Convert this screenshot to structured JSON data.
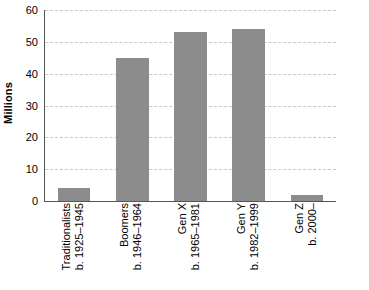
{
  "chart_data": {
    "type": "bar",
    "title": "",
    "xlabel": "",
    "ylabel": "Millions",
    "ylim": [
      0,
      60
    ],
    "grid": true,
    "legend": "none",
    "categories": [
      "Traditionalists b. 1925–1945",
      "Boomers b. 1946–1964",
      "Gen X b. 1965–1981",
      "Gen Y b. 1982–1999",
      "Gen Z b. 2000–"
    ],
    "values": [
      4,
      45,
      53,
      54,
      2
    ],
    "yticks": [
      0,
      10,
      20,
      30,
      40,
      50,
      60
    ],
    "bar_color": "#8c8c8c",
    "gridline_color": "#c8c8c8",
    "axis_color": "#555555"
  },
  "axis": {
    "y_title": "Millions",
    "ticks": [
      {
        "label": "60",
        "value": 60
      },
      {
        "label": "50",
        "value": 50
      },
      {
        "label": "40",
        "value": 40
      },
      {
        "label": "30",
        "value": 30
      },
      {
        "label": "20",
        "value": 20
      },
      {
        "label": "10",
        "value": 10
      },
      {
        "label": "0",
        "value": 0
      }
    ]
  },
  "categories": [
    {
      "name": "Traditionalists",
      "years": "b. 1925–1945",
      "value": 4
    },
    {
      "name": "Boomers",
      "years": "b. 1946–1964",
      "value": 45
    },
    {
      "name": "Gen X",
      "years": "b. 1965–1981",
      "value": 53
    },
    {
      "name": "Gen Y",
      "years": "b. 1982–1999",
      "value": 54
    },
    {
      "name": "Gen Z",
      "years": "b. 2000–",
      "value": 2
    }
  ]
}
